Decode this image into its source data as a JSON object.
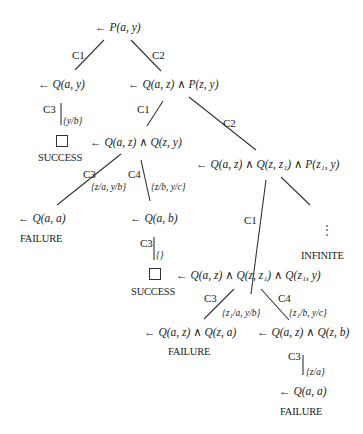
{
  "diagram": {
    "type": "SLD resolution search tree",
    "nodes": {
      "root": "← P(a, y)",
      "n1": "← Q(a, y)",
      "n2": "← Q(a, z) ∧ P(z, y)",
      "n3": "← Q(a, z) ∧ Q(z, y)",
      "n4": "← Q(a, z) ∧ Q(z, z₁) ∧ P(z₁, y)",
      "n5": "← Q(a, a)",
      "n6": "← Q(a, b)",
      "n7": "← Q(a, z) ∧ Q(z, z₁) ∧ Q(z₁, y)",
      "n8": "← Q(a, z) ∧ Q(z, a)",
      "n9": "← Q(a, z) ∧ Q(z, b)",
      "n10": "← Q(a, a)"
    },
    "edge_labels": {
      "root_n1": "C1",
      "root_n2": "C2",
      "n1_success": "C3",
      "n2_n3": "C1",
      "n2_n4": "C2",
      "n3_n5": "C3",
      "n3_n6": "C4",
      "n6_success": "C3",
      "n4_n7": "C1",
      "n7_n8": "C3",
      "n7_n9": "C4",
      "n9_n10": "C3"
    },
    "substitutions": {
      "n1_success": "{y/b}",
      "n3_n5": "{z/a, y/b}",
      "n3_n6": "{z/b, y/c}",
      "n6_success": "{}",
      "n7_n8": "{z₁/a, y/b}",
      "n7_n9": "{z₁/b, y/c}",
      "n9_n10": "{z/a}"
    },
    "status": {
      "success1": "SUCCESS",
      "failure1": "FAILURE",
      "infinite": "INFINITE",
      "success2": "SUCCESS",
      "failure2": "FAILURE",
      "failure3": "FAILURE"
    },
    "ellipsis": "⋮"
  }
}
